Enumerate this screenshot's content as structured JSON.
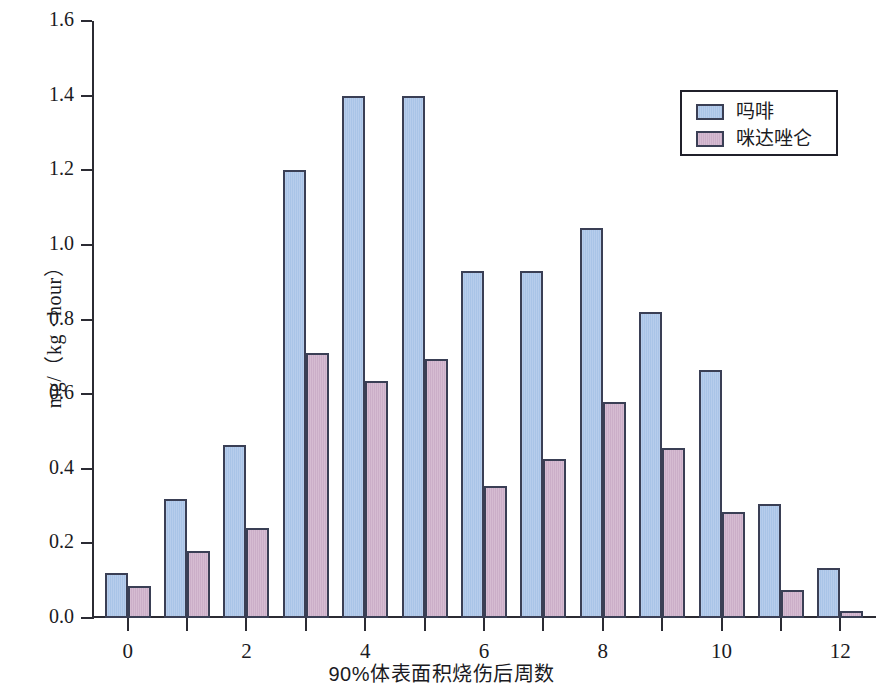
{
  "chart_data": {
    "type": "bar",
    "title": "",
    "xlabel": "90%体表面积烧伤后周数",
    "ylabel": "mg/（kg · hour）",
    "x": [
      0,
      1,
      2,
      3,
      4,
      5,
      6,
      7,
      8,
      9,
      10,
      11,
      12
    ],
    "categories": [
      "0",
      "1",
      "2",
      "3",
      "4",
      "5",
      "6",
      "7",
      "8",
      "9",
      "10",
      "11",
      "12"
    ],
    "xlim": [
      -0.6,
      12.6
    ],
    "ylim": [
      0.0,
      1.6
    ],
    "ytick_labels": [
      "0.0",
      "0.2",
      "0.4",
      "0.6",
      "0.8",
      "1.0",
      "1.2",
      "1.4",
      "1.6"
    ],
    "ytick_values": [
      0.0,
      0.2,
      0.4,
      0.6,
      0.8,
      1.0,
      1.2,
      1.4,
      1.6
    ],
    "xtick_major_labels": [
      "0",
      "2",
      "4",
      "6",
      "8",
      "10",
      "12"
    ],
    "xtick_major_values": [
      0,
      2,
      4,
      6,
      8,
      10,
      12
    ],
    "xtick_minor_values": [
      1,
      3,
      5,
      7,
      9,
      11
    ],
    "grid": false,
    "legend_position": "top-right",
    "series": [
      {
        "name": "吗啡",
        "color": "#aec8e8",
        "edge_color": "#3a3f55",
        "values": [
          0.12,
          0.32,
          0.465,
          1.2,
          1.4,
          1.4,
          0.93,
          0.93,
          1.045,
          0.82,
          0.665,
          0.305,
          0.135
        ]
      },
      {
        "name": "咪达唑仑",
        "color": "#cdb0c8",
        "edge_color": "#3a3f55",
        "values": [
          0.085,
          0.18,
          0.24,
          0.71,
          0.635,
          0.695,
          0.355,
          0.425,
          0.58,
          0.455,
          0.285,
          0.075,
          0.02
        ]
      }
    ]
  }
}
